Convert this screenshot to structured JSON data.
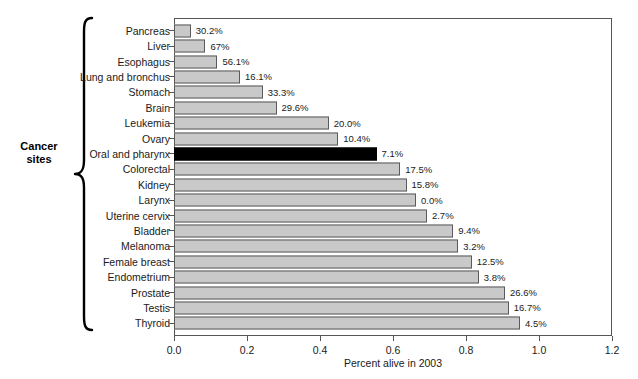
{
  "chart_data": {
    "type": "bar",
    "orientation": "horizontal",
    "title": "",
    "xlabel": "Percent alive in 2003",
    "ylabel": "Cancer sites",
    "xlim": [
      0.0,
      1.2
    ],
    "xticks": [
      "0.0",
      "0.2",
      "0.4",
      "0.6",
      "0.8",
      "1.0",
      "1.2"
    ],
    "xtick_values": [
      0.0,
      0.2,
      0.4,
      0.6,
      0.8,
      1.0,
      1.2
    ],
    "grid": false,
    "legend": null,
    "highlight_color": "#000000",
    "bar_color": "#c9c9c9",
    "bar_border_color": "#5a5a5a",
    "categories": [
      "Pancreas",
      "Liver",
      "Esophagus",
      "Lung and bronchus",
      "Stomach",
      "Brain",
      "Leukemia",
      "Ovary",
      "Oral and pharynx",
      "Colorectal",
      "Kidney",
      "Larynx",
      "Uterine cervix",
      "Bladder",
      "Melanoma",
      "Female breast",
      "Endometrium",
      "Prostate",
      "Testis",
      "Thyroid"
    ],
    "values": [
      0.046,
      0.086,
      0.119,
      0.181,
      0.243,
      0.281,
      0.424,
      0.45,
      0.555,
      0.62,
      0.637,
      0.663,
      0.693,
      0.765,
      0.779,
      0.816,
      0.835,
      0.907,
      0.917,
      0.948
    ],
    "data_labels": [
      "30.2%",
      "67%",
      "56.1%",
      "16.1%",
      "33.3%",
      "29.6%",
      "20.0%",
      "10.4%",
      "7.1%",
      "17.5%",
      "15.8%",
      "0.0%",
      "2.7%",
      "9.4%",
      "3.2%",
      "12.5%",
      "3.8%",
      "26.6%",
      "16.7%",
      "4.5%"
    ],
    "highlighted": [
      false,
      false,
      false,
      false,
      false,
      false,
      false,
      false,
      true,
      false,
      false,
      false,
      false,
      false,
      false,
      false,
      false,
      false,
      false,
      false
    ]
  },
  "axis": {
    "group_label_line1": "Cancer",
    "group_label_line2": "sites"
  }
}
